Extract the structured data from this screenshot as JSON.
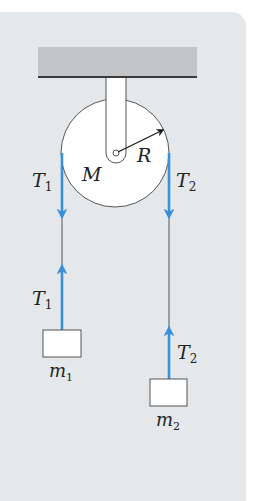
{
  "diagram": {
    "colors": {
      "background": "#e4e8eb",
      "ceiling": "#c4c5c6",
      "ceiling_edge": "#3a3a3a",
      "pulley_fill": "#ffffff",
      "outline": "#555555",
      "rope": "#555555",
      "force_arrow": "#3a8fd6",
      "radius_arrow": "#1a1a1a"
    },
    "labels": {
      "pulley_mass": "M",
      "pulley_radius": "R",
      "tension_left_top": {
        "main": "T",
        "sub": "1"
      },
      "tension_left_bottom": {
        "main": "T",
        "sub": "1"
      },
      "tension_right_top": {
        "main": "T",
        "sub": "2"
      },
      "tension_right_bottom": {
        "main": "T",
        "sub": "2"
      },
      "mass_left": {
        "main": "m",
        "sub": "1"
      },
      "mass_right": {
        "main": "m",
        "sub": "2"
      }
    }
  }
}
